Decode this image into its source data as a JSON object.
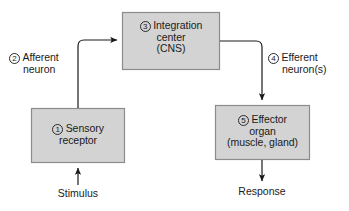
{
  "diagram": {
    "colors": {
      "box_fill": "#d3d3d3",
      "box_border": "#8c8c8c",
      "connector": "#1a1a1a",
      "text": "#1a1a1a"
    },
    "boxes": [
      {
        "id": "sensory-receptor",
        "number": "1",
        "lines": [
          "Sensory",
          "receptor"
        ]
      },
      {
        "id": "integration-center",
        "number": "3",
        "lines": [
          "Integration",
          "center",
          "(CNS)"
        ]
      },
      {
        "id": "effector-organ",
        "number": "5",
        "lines": [
          "Effector",
          "organ",
          "(muscle, gland)"
        ]
      }
    ],
    "edge_labels": [
      {
        "id": "afferent-neuron",
        "number": "2",
        "lines": [
          "Afferent",
          "neuron"
        ]
      },
      {
        "id": "efferent-neuron",
        "number": "4",
        "lines": [
          "Efferent",
          "neuron(s)"
        ]
      }
    ],
    "flow_labels": [
      {
        "id": "stimulus",
        "text": "Stimulus"
      },
      {
        "id": "response",
        "text": "Response"
      }
    ]
  }
}
